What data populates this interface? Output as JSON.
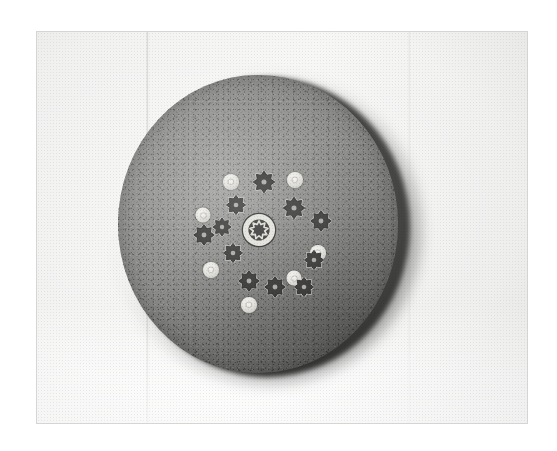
{
  "image": {
    "domain": "natural-image",
    "medium": "black-and-white photograph",
    "subject": "circular porous foam disc with a central rosette of small ring-shaped and cog-shaped beads",
    "orientation": "landscape",
    "width_px": 557,
    "height_px": 451,
    "background_color": "#ffffff",
    "print_area": {
      "left_px": 36,
      "top_px": 31,
      "width_px": 492,
      "height_px": 393,
      "paper_color": "#f3f3f2"
    }
  },
  "disc": {
    "label": "porous disc",
    "center_x_px": 258,
    "center_y_px": 226,
    "radius_px": 141,
    "face_color": "#74746f",
    "rim_shadow_color": "#1d1d1c",
    "texture": "speckled open-cell foam",
    "lighting": "key light upper-left, shadow lower-right"
  },
  "cluster": {
    "label": "central rosette",
    "center_x_px": 262,
    "center_y_px": 228,
    "element_count": 19,
    "bead_color": "#ded d9",
    "cog_color": "#151514",
    "elements": [
      {
        "name": "center-medallion",
        "type": "medallion",
        "x": 141,
        "y": 155,
        "size": 36,
        "teeth": 9
      },
      {
        "name": "bead-n",
        "type": "bead",
        "x": 113,
        "y": 107,
        "size": 16
      },
      {
        "name": "bead-ne",
        "type": "bead",
        "x": 177,
        "y": 105,
        "size": 16
      },
      {
        "name": "bead-w",
        "type": "bead",
        "x": 85,
        "y": 140,
        "size": 15
      },
      {
        "name": "bead-sw",
        "type": "bead",
        "x": 93,
        "y": 195,
        "size": 16
      },
      {
        "name": "bead-e",
        "type": "bead",
        "x": 200,
        "y": 178,
        "size": 16
      },
      {
        "name": "bead-se",
        "type": "bead",
        "x": 176,
        "y": 203,
        "size": 15
      },
      {
        "name": "bead-s",
        "type": "bead",
        "x": 131,
        "y": 230,
        "size": 16
      },
      {
        "name": "cog-n",
        "type": "cog",
        "x": 146,
        "y": 107,
        "size": 22,
        "teeth": 8
      },
      {
        "name": "cog-nnw",
        "type": "cog",
        "x": 118,
        "y": 130,
        "size": 20,
        "teeth": 8
      },
      {
        "name": "cog-nne",
        "type": "cog",
        "x": 176,
        "y": 133,
        "size": 22,
        "teeth": 8
      },
      {
        "name": "cog-wnw",
        "type": "cog",
        "x": 86,
        "y": 160,
        "size": 21,
        "teeth": 8
      },
      {
        "name": "cog-ene",
        "type": "cog",
        "x": 203,
        "y": 146,
        "size": 21,
        "teeth": 8
      },
      {
        "name": "cog-w",
        "type": "cog",
        "x": 115,
        "y": 178,
        "size": 20,
        "teeth": 8
      },
      {
        "name": "cog-e",
        "type": "cog",
        "x": 196,
        "y": 185,
        "size": 20,
        "teeth": 8
      },
      {
        "name": "cog-ssw",
        "type": "cog",
        "x": 131,
        "y": 206,
        "size": 21,
        "teeth": 8
      },
      {
        "name": "cog-s",
        "type": "cog",
        "x": 157,
        "y": 212,
        "size": 21,
        "teeth": 8
      },
      {
        "name": "cog-sse",
        "type": "cog",
        "x": 186,
        "y": 212,
        "size": 20,
        "teeth": 8
      },
      {
        "name": "cog-nw",
        "type": "cog",
        "x": 104,
        "y": 152,
        "size": 19,
        "teeth": 8
      }
    ]
  }
}
